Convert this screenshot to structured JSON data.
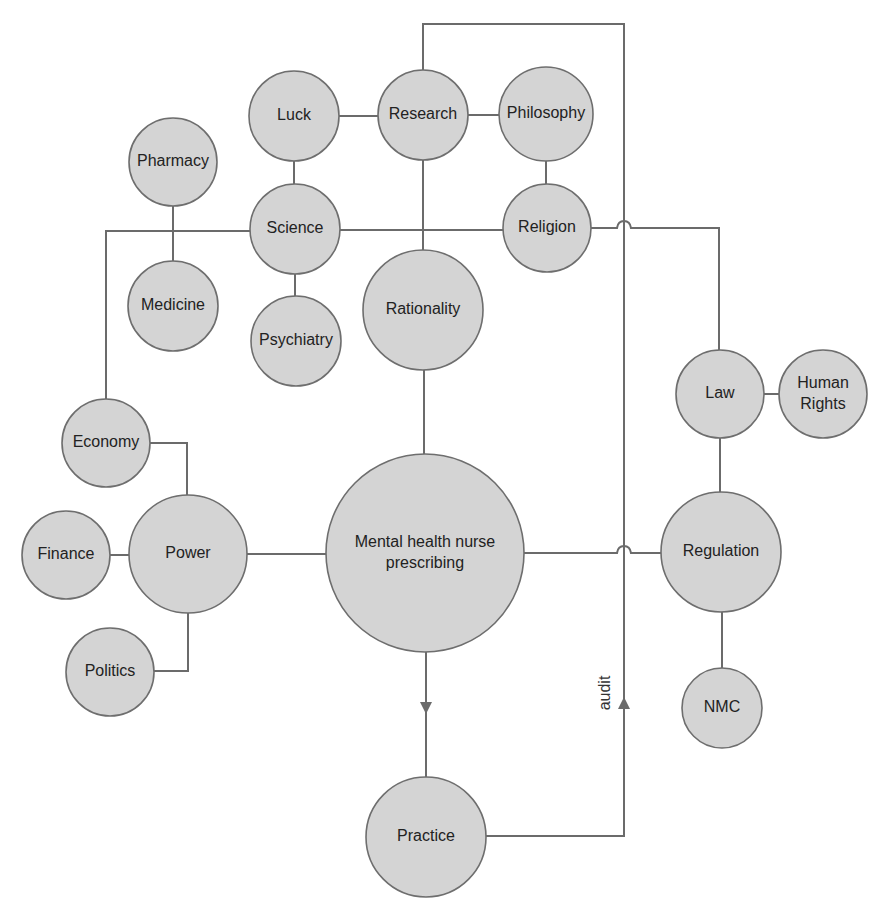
{
  "diagram": {
    "colors": {
      "node_fill": "#d4d4d4",
      "node_stroke": "#6e6e6e",
      "edge": "#6b6b6b",
      "text": "#222222",
      "background": "#ffffff"
    },
    "nodes": [
      {
        "id": "luck",
        "label": "Luck",
        "cx": 294,
        "cy": 116,
        "r": 45
      },
      {
        "id": "research",
        "label": "Research",
        "cx": 423,
        "cy": 115,
        "r": 45
      },
      {
        "id": "philosophy",
        "label": "Philosophy",
        "cx": 546,
        "cy": 114,
        "r": 47
      },
      {
        "id": "pharmacy",
        "label": "Pharmacy",
        "cx": 173,
        "cy": 162,
        "r": 44
      },
      {
        "id": "science",
        "label": "Science",
        "cx": 295,
        "cy": 229,
        "r": 45
      },
      {
        "id": "religion",
        "label": "Religion",
        "cx": 547,
        "cy": 228,
        "r": 44
      },
      {
        "id": "medicine",
        "label": "Medicine",
        "cx": 173,
        "cy": 306,
        "r": 45
      },
      {
        "id": "psychiatry",
        "label": "Psychiatry",
        "cx": 296,
        "cy": 341,
        "r": 45
      },
      {
        "id": "rationality",
        "label": "Rationality",
        "cx": 423,
        "cy": 310,
        "r": 60
      },
      {
        "id": "law",
        "label": "Law",
        "cx": 720,
        "cy": 394,
        "r": 44
      },
      {
        "id": "human-rights",
        "label_lines": [
          "Human",
          "Rights"
        ],
        "cx": 823,
        "cy": 394,
        "r": 44
      },
      {
        "id": "economy",
        "label": "Economy",
        "cx": 106,
        "cy": 443,
        "r": 44
      },
      {
        "id": "finance",
        "label": "Finance",
        "cx": 66,
        "cy": 555,
        "r": 44
      },
      {
        "id": "power",
        "label": "Power",
        "cx": 188,
        "cy": 554,
        "r": 59
      },
      {
        "id": "mental-health-nurse-prescribing",
        "label_lines": [
          "Mental health nurse",
          "prescribing"
        ],
        "cx": 425,
        "cy": 553,
        "r": 99
      },
      {
        "id": "regulation",
        "label": "Regulation",
        "cx": 721,
        "cy": 552,
        "r": 60
      },
      {
        "id": "politics",
        "label": "Politics",
        "cx": 110,
        "cy": 672,
        "r": 44
      },
      {
        "id": "nmc",
        "label": "NMC",
        "cx": 722,
        "cy": 708,
        "r": 40
      },
      {
        "id": "practice",
        "label": "Practice",
        "cx": 426,
        "cy": 837,
        "r": 60
      }
    ],
    "edges": [
      {
        "from": "luck",
        "to": "research"
      },
      {
        "from": "research",
        "to": "philosophy"
      },
      {
        "from": "luck",
        "to": "science"
      },
      {
        "from": "philosophy",
        "to": "religion"
      },
      {
        "from": "pharmacy",
        "to": "medicine"
      },
      {
        "from": "science",
        "to": "psychiatry"
      },
      {
        "from": "science",
        "to": "religion"
      },
      {
        "from": "science",
        "to": "economy"
      },
      {
        "from": "research",
        "to": "rationality"
      },
      {
        "from": "rationality",
        "to": "mental-health-nurse-prescribing"
      },
      {
        "from": "religion",
        "to": "law"
      },
      {
        "from": "law",
        "to": "human-rights"
      },
      {
        "from": "law",
        "to": "regulation"
      },
      {
        "from": "regulation",
        "to": "nmc"
      },
      {
        "from": "economy",
        "to": "power"
      },
      {
        "from": "finance",
        "to": "power"
      },
      {
        "from": "politics",
        "to": "power"
      },
      {
        "from": "power",
        "to": "mental-health-nurse-prescribing"
      },
      {
        "from": "mental-health-nurse-prescribing",
        "to": "regulation"
      },
      {
        "from": "mental-health-nurse-prescribing",
        "to": "practice",
        "arrow": "down"
      },
      {
        "from": "practice",
        "to": "research",
        "label": "audit",
        "arrow": "up"
      }
    ],
    "edge_labels": {
      "audit": "audit"
    },
    "labels": {
      "luck": "Luck",
      "research": "Research",
      "philosophy": "Philosophy",
      "pharmacy": "Pharmacy",
      "science": "Science",
      "religion": "Religion",
      "medicine": "Medicine",
      "psychiatry": "Psychiatry",
      "rationality": "Rationality",
      "law": "Law",
      "human_rights_1": "Human",
      "human_rights_2": "Rights",
      "economy": "Economy",
      "finance": "Finance",
      "power": "Power",
      "mhnp_1": "Mental health nurse",
      "mhnp_2": "prescribing",
      "regulation": "Regulation",
      "politics": "Politics",
      "nmc": "NMC",
      "practice": "Practice"
    }
  }
}
